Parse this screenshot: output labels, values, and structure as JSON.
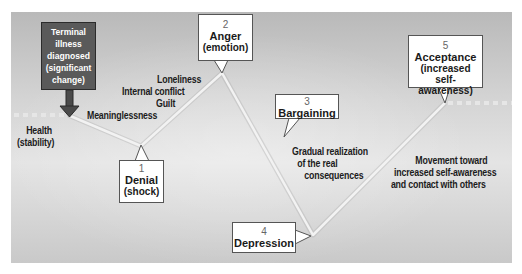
{
  "colors": {
    "background_panel": "#cfcfcf",
    "dark_box": "#5a5a5a",
    "callout_bg": "#ffffff",
    "line": "#ececec",
    "text": "#1c1c1c"
  },
  "start_box": {
    "lines": [
      "Terminal",
      "illness",
      "diagnosed",
      "(significant",
      "change)"
    ],
    "icon": "down-arrow-icon"
  },
  "labels": {
    "health": [
      "Health",
      "(stability)"
    ],
    "meaninglessness": "Meaninglessness",
    "guilt": "Guilt",
    "internal_conflict": "Internal conflict",
    "loneliness": "Loneliness",
    "gradual_realization": [
      "Gradual realization",
      "of the real",
      "consequences"
    ],
    "movement_toward": [
      "Movement toward",
      "increased self-awareness",
      "and contact with others"
    ]
  },
  "stages": [
    {
      "number": "1",
      "title": "Denial",
      "subtitle": "(shock)"
    },
    {
      "number": "2",
      "title": "Anger",
      "subtitle": "(emotion)"
    },
    {
      "number": "3",
      "title": "Bargaining",
      "subtitle": ""
    },
    {
      "number": "4",
      "title": "Depression",
      "subtitle": ""
    },
    {
      "number": "5",
      "title": "Acceptance",
      "subtitle": "(increased self-awareness)"
    }
  ],
  "acceptance_subtitle_lines": [
    "(increased self-",
    "awareness)"
  ]
}
